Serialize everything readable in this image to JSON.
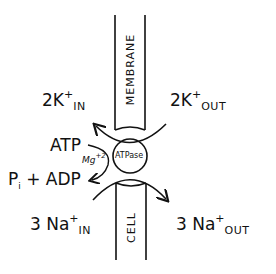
{
  "diagram": {
    "membrane_label": "MEMBRANE",
    "cell_label": "CELL",
    "enzyme_label": "ATPase",
    "cofactor": {
      "base": "Mg",
      "charge": "+2"
    },
    "reactants": {
      "atp": "ATP",
      "products_pi": "P",
      "products_pi_sub": "i",
      "products_rest": "+ ADP"
    },
    "ions": {
      "k_in": {
        "coef": "2K",
        "charge": "+",
        "side": "IN"
      },
      "k_out": {
        "coef": "2K",
        "charge": "+",
        "side": "OUT"
      },
      "na_in": {
        "coef": "3 Na",
        "charge": "+",
        "side": "IN"
      },
      "na_out": {
        "coef": "3 Na",
        "charge": "+",
        "side": "OUT"
      }
    },
    "colors": {
      "ink": "#111111",
      "background": "#ffffff"
    }
  }
}
